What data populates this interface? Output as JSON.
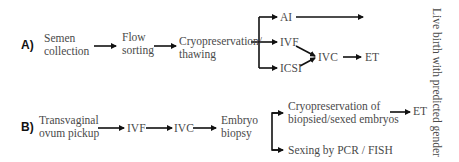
{
  "panel_a": {
    "label": "A)",
    "nodes": {
      "semen_collection_1": "Semen",
      "semen_collection_2": "collection",
      "flow_sorting_1": "Flow",
      "flow_sorting_2": "sorting",
      "cryo_1": "Cryopreservation/",
      "cryo_2": "thawing",
      "ai": "AI",
      "ivf": "IVF",
      "icsi": "ICSI",
      "ivc": "IVC",
      "et": "ET"
    },
    "edges": [
      [
        "Semen collection",
        "Flow sorting"
      ],
      [
        "Flow sorting",
        "Cryopreservation/thawing"
      ],
      [
        "Cryopreservation/thawing",
        "AI"
      ],
      [
        "Cryopreservation/thawing",
        "IVF"
      ],
      [
        "Cryopreservation/thawing",
        "ICSI"
      ],
      [
        "AI",
        "Live birth with predicted gender"
      ],
      [
        "IVF",
        "IVC"
      ],
      [
        "ICSI",
        "IVC"
      ],
      [
        "IVC",
        "ET"
      ]
    ]
  },
  "panel_b": {
    "label": "B)",
    "nodes": {
      "opu_1": "Transvaginal",
      "opu_2": "ovum pickup",
      "ivf": "IVF",
      "ivc": "IVC",
      "biopsy_1": "Embryo",
      "biopsy_2": "biopsy",
      "cryo_1": "Cryopreservation of",
      "cryo_2": "biopsied/sexed embryos",
      "sexing": "Sexing by PCR / FISH",
      "et": "ET"
    },
    "edges": [
      [
        "Transvaginal ovum pickup",
        "IVF"
      ],
      [
        "IVF",
        "IVC"
      ],
      [
        "IVC",
        "Embryo biopsy"
      ],
      [
        "Embryo biopsy",
        "Cryopreservation of biopsied/sexed embryos"
      ],
      [
        "Embryo biopsy",
        "Sexing by PCR / FISH"
      ],
      [
        "Cryopreservation of biopsied/sexed embryos",
        "ET"
      ]
    ]
  },
  "outcome": "Live birth with predicted gender"
}
